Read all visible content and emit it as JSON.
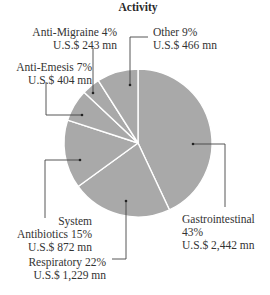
{
  "chart_data": {
    "type": "pie",
    "title": "Activity",
    "unit": "U.S.$ mn",
    "slice_color": "#a9a9a9",
    "separator_color": "#ffffff",
    "start_angle_deg": 0,
    "direction": "clockwise",
    "slices": [
      {
        "name": "Gastrointestinal",
        "percent": 43,
        "value": 2442,
        "pct_label": "43%",
        "value_label": "U.S.$ 2,442 mn"
      },
      {
        "name": "Respiratory",
        "percent": 22,
        "value": 1229,
        "pct_label": "22%",
        "value_label": "U.S.$ 1,229 mn"
      },
      {
        "name": "System Antibiotics",
        "percent": 15,
        "value": 872,
        "pct_label": "15%",
        "value_label": "U.S.$ 872 mn"
      },
      {
        "name": "Anti-Emesis",
        "percent": 7,
        "value": 404,
        "pct_label": "7%",
        "value_label": "U.S.$ 404 mn"
      },
      {
        "name": "Anti-Migraine",
        "percent": 4,
        "value": 243,
        "pct_label": "4%",
        "value_label": "U.S.$ 243 mn"
      },
      {
        "name": "Other",
        "percent": 9,
        "value": 466,
        "pct_label": "9%",
        "value_label": "U.S.$ 466 mn"
      }
    ]
  },
  "labels": {
    "title": "Activity",
    "other_line1": "Other  9%",
    "other_line2": "U.S.$ 466 mn",
    "migraine_line1": "Anti-Migraine  4%",
    "migraine_line2": "U.S.$ 243 mn",
    "emesis_line1": "Anti-Emesis  7%",
    "emesis_line2": "U.S.$ 404 mn",
    "antibiotics_line1": "System",
    "antibiotics_line2": "Antibiotics  15%",
    "antibiotics_line3": "U.S.$ 872 mn",
    "respiratory_line1": "Respiratory  22%",
    "respiratory_line2": "U.S.$ 1,229 mn",
    "gastro_line1": "Gastrointestinal",
    "gastro_line2": "43%",
    "gastro_line3": "U.S.$ 2,442 mn"
  }
}
